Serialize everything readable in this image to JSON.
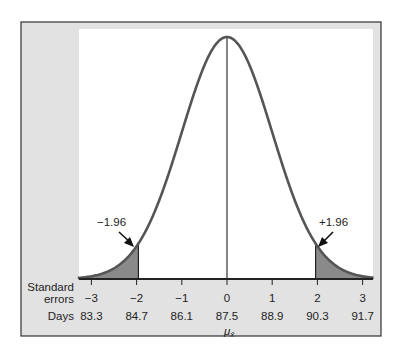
{
  "chart_data": {
    "type": "area",
    "title": "",
    "xlabel": "",
    "ylabel": "",
    "axis_rows": [
      {
        "label": "Standard errors",
        "ticks": [
          "−3",
          "−2",
          "−1",
          "0",
          "1",
          "2",
          "3"
        ]
      },
      {
        "label": "Days",
        "ticks": [
          "83.3",
          "84.7",
          "86.1",
          "87.5",
          "88.9",
          "90.3",
          "91.7"
        ]
      }
    ],
    "z": [
      -3,
      -2,
      -1,
      0,
      1,
      2,
      3
    ],
    "days": [
      83.3,
      84.7,
      86.1,
      87.5,
      88.9,
      90.3,
      91.7
    ],
    "mean_label": "μ",
    "mean_subscript": "x̄",
    "mean_days": 87.5,
    "critical_values": [
      -1.96,
      1.96
    ],
    "shaded_regions": [
      {
        "from": -3.5,
        "to": -1.96
      },
      {
        "from": 1.96,
        "to": 3.5
      }
    ],
    "annotations": [
      {
        "text": "−1.96",
        "points_to": -1.96
      },
      {
        "text": "+1.96",
        "points_to": 1.96
      }
    ],
    "xlim": [
      -3.3,
      3.25
    ],
    "grid": false,
    "legend": "none"
  },
  "labels": {
    "row1_line1": "Standard",
    "row1_line2": "errors",
    "row2": "Days",
    "left_crit": "−1.96",
    "right_crit": "+1.96",
    "mu": "μ",
    "mu_sub": "x̄"
  },
  "colors": {
    "frame_bg": "#e2e2e2",
    "plot_bg": "#ffffff",
    "curve": "#555555",
    "shade": "#8a8a8a",
    "axis": "#222222"
  }
}
